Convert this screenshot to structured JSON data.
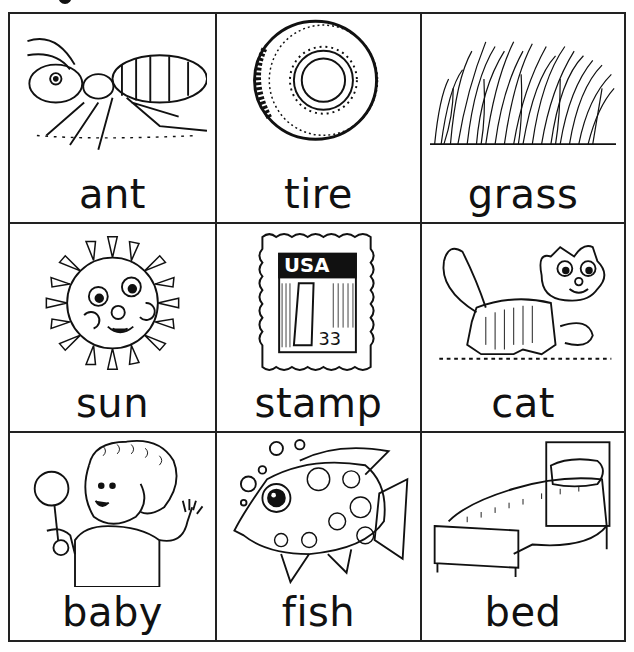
{
  "worksheet": {
    "heading_glyph": "g",
    "cells": [
      {
        "word": "ant",
        "picture": "ant-illustration"
      },
      {
        "word": "tire",
        "picture": "tire-illustration"
      },
      {
        "word": "grass",
        "picture": "grass-illustration"
      },
      {
        "word": "sun",
        "picture": "sun-illustration"
      },
      {
        "word": "stamp",
        "picture": "stamp-illustration",
        "stamp_text": "USA",
        "stamp_value": "33"
      },
      {
        "word": "cat",
        "picture": "cat-illustration"
      },
      {
        "word": "baby",
        "picture": "baby-illustration"
      },
      {
        "word": "fish",
        "picture": "fish-illustration"
      },
      {
        "word": "bed",
        "picture": "bed-illustration"
      }
    ]
  }
}
